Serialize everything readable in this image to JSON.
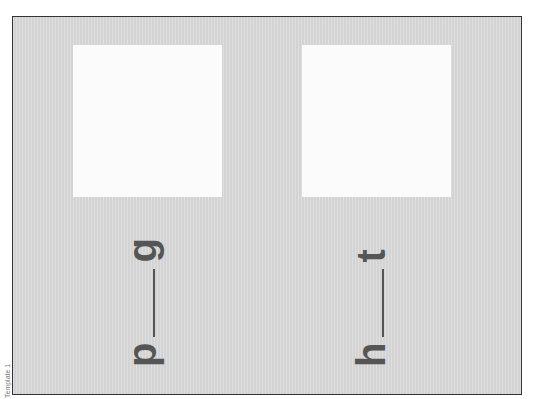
{
  "side_label": "Template 1",
  "cards": [
    {
      "image_box": "blank",
      "word": {
        "first_letter": "p",
        "last_letter": "g"
      }
    },
    {
      "image_box": "blank",
      "word": {
        "first_letter": "h",
        "last_letter": "t"
      }
    }
  ],
  "colors": {
    "background": "#dadada",
    "box": "#fbfbfb",
    "text": "#555555",
    "border": "#333333"
  }
}
